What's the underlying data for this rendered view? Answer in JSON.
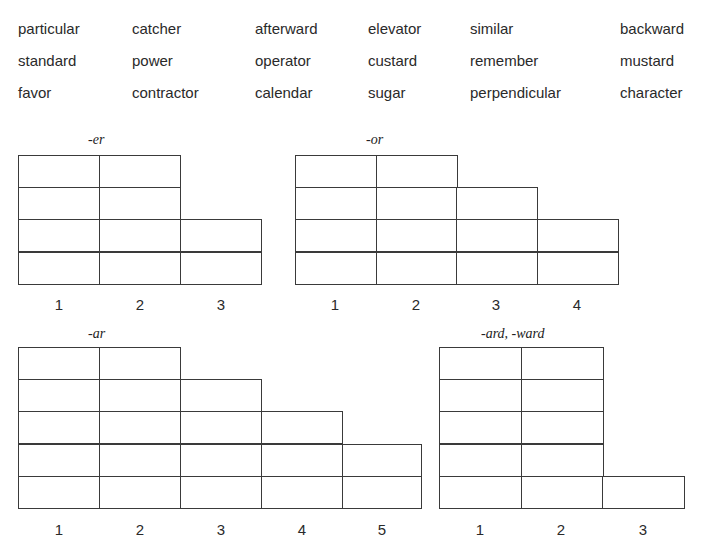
{
  "word_bank": {
    "columns_x": [
      18,
      132,
      255,
      368,
      470,
      620
    ],
    "rows_y": [
      20,
      52,
      84
    ],
    "rows": [
      [
        "particular",
        "catcher",
        "afterward",
        "elevator",
        "similar",
        "backward"
      ],
      [
        "standard",
        "power",
        "operator",
        "custard",
        "remember",
        "mustard"
      ],
      [
        "favor",
        "contractor",
        "calendar",
        "sugar",
        "perpendicular",
        "character"
      ]
    ]
  },
  "charts": [
    {
      "id": "er",
      "title": "-er",
      "title_x": 88,
      "title_y": 132,
      "left": 18,
      "bottom": 284,
      "col_width": 81,
      "row_height": 32.3,
      "column_heights": [
        4,
        4,
        2
      ],
      "column_labels": [
        "1",
        "2",
        "3"
      ],
      "label_y": 296
    },
    {
      "id": "or",
      "title": "-or",
      "title_x": 366,
      "title_y": 132,
      "left": 295,
      "bottom": 284,
      "col_width": 80.5,
      "row_height": 32.3,
      "column_heights": [
        4,
        4,
        3,
        2
      ],
      "column_labels": [
        "1",
        "2",
        "3",
        "4"
      ],
      "label_y": 296
    },
    {
      "id": "ar",
      "title": "-ar",
      "title_x": 88,
      "title_y": 326,
      "left": 18,
      "bottom": 508,
      "col_width": 81,
      "row_height": 32.2,
      "column_heights": [
        5,
        5,
        4,
        3,
        2
      ],
      "column_labels": [
        "1",
        "2",
        "3",
        "4",
        "5"
      ],
      "label_y": 521,
      "last_col_width": 79
    },
    {
      "id": "ard-ward",
      "title": "-ard, -ward",
      "title_x": 481,
      "title_y": 326,
      "left": 439,
      "bottom": 508,
      "col_width": 81.5,
      "row_height": 32.2,
      "column_heights": [
        5,
        5,
        1
      ],
      "column_labels": [
        "1",
        "2",
        "3"
      ],
      "label_y": 521
    }
  ]
}
